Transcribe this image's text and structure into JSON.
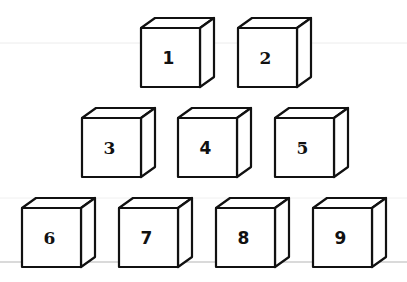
{
  "diagram": {
    "type": "cube-arrangement",
    "rows": [
      {
        "cubes": [
          {
            "label": "1",
            "x": 141,
            "y": 28,
            "font": "sans"
          },
          {
            "label": "2",
            "x": 238,
            "y": 28,
            "font": "serif"
          }
        ]
      },
      {
        "cubes": [
          {
            "label": "3",
            "x": 82,
            "y": 118,
            "font": "serif"
          },
          {
            "label": "4",
            "x": 178,
            "y": 118,
            "font": "sans"
          },
          {
            "label": "5",
            "x": 275,
            "y": 118,
            "font": "serif"
          }
        ]
      },
      {
        "cubes": [
          {
            "label": "6",
            "x": 22,
            "y": 208,
            "font": "serif"
          },
          {
            "label": "7",
            "x": 119,
            "y": 208,
            "font": "sans"
          },
          {
            "label": "8",
            "x": 216,
            "y": 208,
            "font": "sans"
          },
          {
            "label": "9",
            "x": 313,
            "y": 208,
            "font": "sans"
          }
        ]
      }
    ],
    "cube_size": 59,
    "depth_dx": 14,
    "depth_dy": 10,
    "stroke_color": "#111111",
    "face_color": "#ffffff",
    "guide_line_color": "#e6e6e6",
    "baseline_color": "#b5b5b5"
  },
  "labels": {
    "c1": "1",
    "c2": "2",
    "c3": "3",
    "c4": "4",
    "c5": "5",
    "c6": "6",
    "c7": "7",
    "c8": "8",
    "c9": "9"
  }
}
